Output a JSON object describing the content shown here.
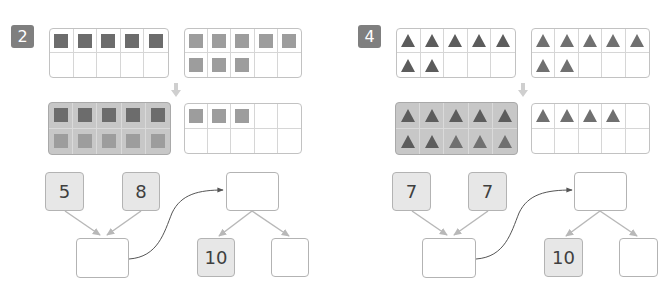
{
  "colors": {
    "square_dark": "#6c6c6c",
    "square_light": "#9d9d9d",
    "triangle_dark": "#5c5c5c",
    "triangle_light": "#707070",
    "badge": "#7f7f7f",
    "given_box_fill": "#e7e7e7",
    "highlight_frame": "#c7c7c7"
  },
  "problems": [
    {
      "number": "2",
      "shape": "square",
      "frames": {
        "top_left": [
          "d",
          "d",
          "d",
          "d",
          "d",
          "",
          "",
          "",
          "",
          ""
        ],
        "top_right": [
          "l",
          "l",
          "l",
          "l",
          "l",
          "l",
          "l",
          "l",
          "",
          ""
        ],
        "bottom_left": [
          "d",
          "d",
          "d",
          "d",
          "d",
          "l",
          "l",
          "l",
          "l",
          "l"
        ],
        "bottom_right": [
          "l",
          "l",
          "l",
          "",
          "",
          "",
          "",
          "",
          "",
          ""
        ]
      },
      "bond": {
        "addend_1": "5",
        "addend_2": "8",
        "sum": "",
        "total": "",
        "part_tens": "10",
        "part_ones": ""
      }
    },
    {
      "number": "4",
      "shape": "triangle",
      "frames": {
        "top_left": [
          "d",
          "d",
          "d",
          "d",
          "d",
          "d",
          "d",
          "",
          "",
          ""
        ],
        "top_right": [
          "l",
          "l",
          "l",
          "l",
          "l",
          "l",
          "l",
          "",
          "",
          ""
        ],
        "bottom_left": [
          "d",
          "d",
          "d",
          "d",
          "d",
          "d",
          "d",
          "l",
          "l",
          "l"
        ],
        "bottom_right": [
          "l",
          "l",
          "l",
          "l",
          "",
          "",
          "",
          "",
          "",
          ""
        ]
      },
      "bond": {
        "addend_1": "7",
        "addend_2": "7",
        "sum": "",
        "total": "",
        "part_tens": "10",
        "part_ones": ""
      }
    }
  ]
}
